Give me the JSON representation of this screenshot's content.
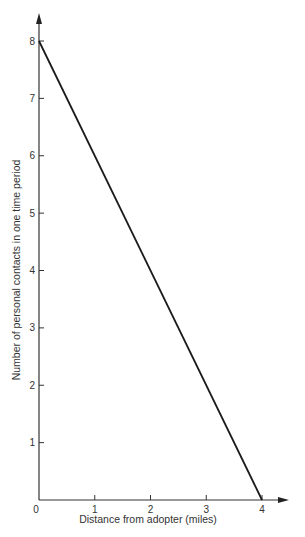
{
  "chart_data": {
    "type": "line",
    "title": "",
    "xlabel": "Distance from adopter (miles)",
    "ylabel": "Number of personal contacts in one time period",
    "xlim": [
      0,
      4
    ],
    "ylim": [
      0,
      8
    ],
    "x_ticks": [
      "0",
      "1",
      "2",
      "3",
      "4"
    ],
    "y_ticks": [
      "1",
      "2",
      "3",
      "4",
      "5",
      "6",
      "7",
      "8"
    ],
    "grid": false,
    "legend": null,
    "series": [
      {
        "name": "contacts",
        "x": [
          0,
          4
        ],
        "y": [
          8,
          0
        ]
      }
    ]
  },
  "colors": {
    "line": "#1a1a1a",
    "axis": "#333333",
    "background": "#ffffff"
  }
}
